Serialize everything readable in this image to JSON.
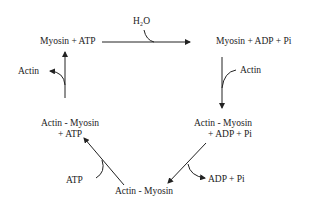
{
  "diagram": {
    "nodes": {
      "myosin_atp": "Myosin + ATP",
      "myosin_adp_pi": "Myosin + ADP + Pi",
      "actin_myosin_adp_pi_line1": "Actin - Myosin",
      "actin_myosin_adp_pi_line2": "+ ADP + Pi",
      "actin_myosin": "Actin - Myosin",
      "actin_myosin_atp_line1": "Actin - Myosin",
      "actin_myosin_atp_line2": "+ ATP"
    },
    "side_labels": {
      "h2o": "H₂O",
      "actin_in": "Actin",
      "adp_pi_out": "ADP + Pi",
      "atp_in": "ATP",
      "actin_out": "Actin"
    },
    "colors": {
      "line": "#222222",
      "background": "#ffffff"
    }
  }
}
